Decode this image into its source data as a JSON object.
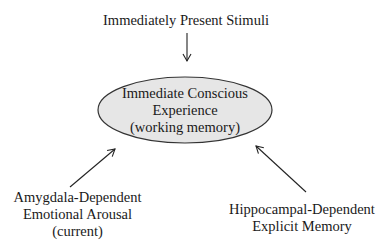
{
  "diagram": {
    "top_node": {
      "lines": [
        "Immediately Present Stimuli"
      ]
    },
    "center_node": {
      "lines": [
        "Immediate Conscious",
        "Experience",
        "(working memory)"
      ],
      "fill": "#e6e6e6",
      "stroke": "#333333"
    },
    "left_node": {
      "lines": [
        "Amygdala-Dependent",
        "Emotional Arousal",
        "(current)"
      ]
    },
    "right_node": {
      "lines": [
        "Hippocampal-Dependent",
        "Explicit Memory"
      ]
    },
    "edges": [
      {
        "from": "top_node",
        "to": "center_node"
      },
      {
        "from": "left_node",
        "to": "center_node"
      },
      {
        "from": "right_node",
        "to": "center_node"
      }
    ]
  }
}
